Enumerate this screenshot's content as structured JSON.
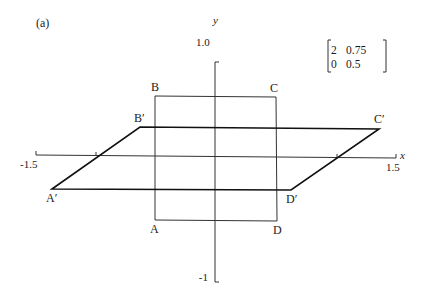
{
  "figure": {
    "panel_label": "(a)",
    "axes": {
      "x_label": "x",
      "y_label": "y",
      "x_ticks": [
        "-1.5",
        "1.5"
      ],
      "y_ticks": [
        "1.0",
        "-1"
      ]
    },
    "matrix": {
      "row1": [
        "2",
        "0.75"
      ],
      "row2": [
        "0",
        "0.5"
      ]
    },
    "original_square": {
      "vertices": [
        "A",
        "B",
        "C",
        "D"
      ]
    },
    "transformed_parallelogram": {
      "vertices": [
        "A′",
        "B′",
        "C′",
        "D′"
      ]
    },
    "colors": {
      "line": "#333333",
      "background": "#ffffff"
    }
  }
}
